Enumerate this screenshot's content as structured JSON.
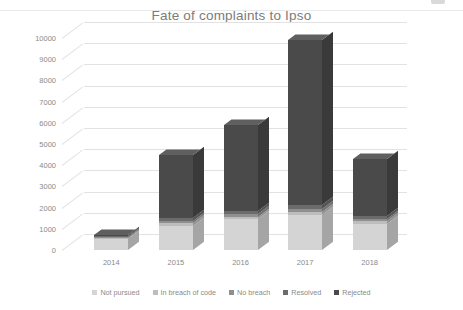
{
  "chart_data": {
    "type": "bar",
    "subtype": "stacked-column-3d",
    "title": "Fate of complaints to Ipso",
    "xlabel": "",
    "ylabel": "",
    "categories": [
      "2014",
      "2015",
      "2016",
      "2017",
      "2018"
    ],
    "ylim": [
      0,
      10000
    ],
    "ytick_step": 1000,
    "yticks": [
      "0",
      "1000",
      "2000",
      "3000",
      "4000",
      "5000",
      "6000",
      "7000",
      "8000",
      "9000",
      "10000"
    ],
    "grid": true,
    "legend_position": "bottom",
    "series": [
      {
        "name": "Not pursued",
        "color": "#d4d4d4",
        "values": [
          520,
          1150,
          1450,
          1650,
          1250
        ]
      },
      {
        "name": "In breach of code",
        "color": "#bdbdbd",
        "values": [
          40,
          120,
          130,
          150,
          120
        ]
      },
      {
        "name": "No breach",
        "color": "#8f8f8f",
        "values": [
          40,
          110,
          120,
          140,
          110
        ]
      },
      {
        "name": "Resolved",
        "color": "#6b6b6b",
        "values": [
          40,
          130,
          150,
          170,
          130
        ]
      },
      {
        "name": "Rejected",
        "color": "#4a4a4a",
        "values": [
          60,
          2990,
          4050,
          7790,
          2690
        ]
      }
    ],
    "totals": [
      700,
      4500,
      5900,
      9900,
      4300
    ]
  },
  "legend": {
    "items": [
      {
        "label": "Not pursued"
      },
      {
        "label": "In breach of code"
      },
      {
        "label": "No breach"
      },
      {
        "label": "Resolved"
      },
      {
        "label": "Rejected"
      }
    ]
  },
  "colors": {
    "background": "#ffffff",
    "gridline": "#e2e2e2",
    "text": "#8a8a8a",
    "title": "#7b7b7b"
  }
}
